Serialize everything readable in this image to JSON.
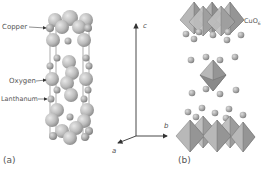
{
  "panel_a": {
    "caption": "(a)",
    "labels": {
      "copper": "Copper",
      "oxygen": "Oxygen",
      "lanthanum": "Lanthanum"
    }
  },
  "axes": {
    "a": "a",
    "b": "b",
    "c": "c"
  },
  "panel_b": {
    "caption": "(b)",
    "octahedron_label": "CuO",
    "octahedron_subscript": "6"
  },
  "colors": {
    "atom_large": "#b8b8b8",
    "atom_small": "#a8a8a8",
    "octahedron_light": "#b0b0b0",
    "octahedron_dark": "#8a8a8a",
    "axis": "#333333",
    "text": "#555555"
  }
}
